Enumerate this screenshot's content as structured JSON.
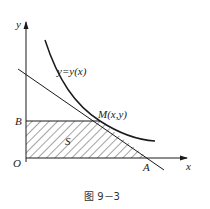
{
  "figure": {
    "caption": "图 9－3",
    "labels": {
      "y_axis": "y",
      "x_axis": "x",
      "origin": "O",
      "point_b": "B",
      "point_a": "A",
      "point_m": "M(x,y)",
      "curve": "y=y(x)",
      "region": "S"
    },
    "colors": {
      "stroke": "#1a1a1a",
      "hatch": "#333333",
      "background": "#ffffff"
    }
  }
}
